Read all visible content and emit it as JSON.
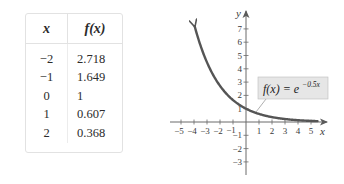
{
  "table": {
    "headers": {
      "x": "x",
      "f": "f(x)"
    },
    "rows": [
      {
        "x": "−2",
        "f": "2.718"
      },
      {
        "x": "−1",
        "f": "1.649"
      },
      {
        "x": "0",
        "f": "1"
      },
      {
        "x": "1",
        "f": "0.607"
      },
      {
        "x": "2",
        "f": "0.368"
      }
    ]
  },
  "chart_data": {
    "type": "line",
    "title": "",
    "function": "f(x) = e^(-0.5x)",
    "annotation": {
      "prefix": "f(x) = e",
      "exponent": "−0.5x"
    },
    "xlabel": "x",
    "ylabel": "y",
    "xlim": [
      -5,
      5
    ],
    "ylim": [
      -3,
      7
    ],
    "x_ticks": [
      "−5",
      "−4",
      "−3",
      "−2",
      "−1",
      "1",
      "2",
      "3",
      "4",
      "5"
    ],
    "y_ticks": [
      "7",
      "6",
      "5",
      "4",
      "3",
      "2",
      "1",
      "−1",
      "−2",
      "−3"
    ],
    "grid": false,
    "series": [
      {
        "name": "f(x) = e^(-0.5x)",
        "x": [
          -4,
          -3,
          -2,
          -1,
          0,
          1,
          2,
          3,
          4,
          5
        ],
        "y": [
          7.389,
          4.482,
          2.718,
          1.649,
          1,
          0.607,
          0.368,
          0.223,
          0.135,
          0.082
        ]
      }
    ],
    "colors": {
      "curve": "#555555",
      "axis": "#6a6a6a",
      "label_box": "#e6e6e6"
    }
  }
}
